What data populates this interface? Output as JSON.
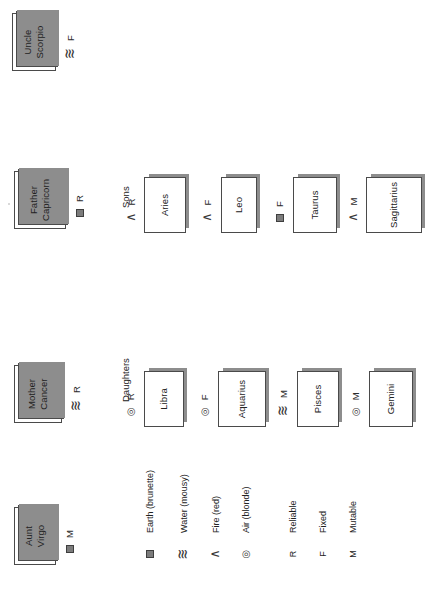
{
  "diagram": {
    "title_type": "family-tree",
    "orientation": "rotated-90-ccw",
    "parents": [
      {
        "id": "aunt-virgo",
        "line1": "Aunt",
        "line2": "Virgo",
        "element": "earth",
        "quality_letter": "M"
      },
      {
        "id": "mother-cancer",
        "line1": "Mother",
        "line2": "Cancer",
        "element": "water",
        "quality_letter": "R"
      },
      {
        "id": "father-capricorn",
        "line1": "Father",
        "line2": "Capricorn",
        "element": "earth",
        "quality_letter": "R"
      },
      {
        "id": "uncle-scorpio",
        "line1": "Uncle",
        "line2": "Scorpio",
        "element": "water",
        "quality_letter": "F"
      }
    ],
    "groups": [
      {
        "id": "daughters",
        "caption": "Daughters"
      },
      {
        "id": "sons",
        "caption": "Sons"
      }
    ],
    "daughters": [
      {
        "id": "libra",
        "label": "Libra",
        "element": "air",
        "quality_letter": "R"
      },
      {
        "id": "aquarius",
        "label": "Aquarius",
        "element": "air",
        "quality_letter": "F"
      },
      {
        "id": "pisces",
        "label": "Pisces",
        "element": "water",
        "quality_letter": "M"
      },
      {
        "id": "gemini",
        "label": "Gemini",
        "element": "air",
        "quality_letter": "M"
      }
    ],
    "sons": [
      {
        "id": "aries",
        "label": "Aries",
        "element": "fire",
        "quality_letter": "R"
      },
      {
        "id": "leo",
        "label": "Leo",
        "element": "fire",
        "quality_letter": "F"
      },
      {
        "id": "taurus",
        "label": "Taurus",
        "element": "earth",
        "quality_letter": "F"
      },
      {
        "id": "sagittarius",
        "label": "Sagittarius",
        "element": "fire",
        "quality_letter": "M"
      }
    ]
  },
  "legend": {
    "elements": [
      {
        "id": "earth",
        "symbol_name": "earth-square-icon",
        "label": "Earth (brunette)"
      },
      {
        "id": "water",
        "symbol_name": "water-wave-icon",
        "label": "Water (mousy)"
      },
      {
        "id": "fire",
        "symbol_name": "fire-caret-icon",
        "label": "Fire (red)"
      },
      {
        "id": "air",
        "symbol_name": "air-spiral-icon",
        "label": "Air (blonde)"
      }
    ],
    "qualities": [
      {
        "id": "reliable",
        "letter": "R",
        "label": "Reliable"
      },
      {
        "id": "fixed",
        "letter": "F",
        "label": "Fixed"
      },
      {
        "id": "mutable",
        "letter": "M",
        "label": "Mutable"
      }
    ]
  },
  "colors": {
    "card_border": "#4a4a4a",
    "card_fill": "#ffffff",
    "shadow": "#8d8d8d",
    "earth_fill": "#7c7c7c",
    "text": "#222222",
    "page_bg": "#ffffff"
  },
  "glyphs": {
    "earth": "",
    "water": "≋",
    "fire": "∧",
    "air": "◎"
  }
}
